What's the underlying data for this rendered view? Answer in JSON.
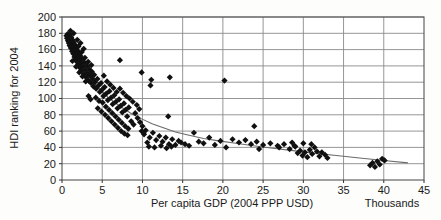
{
  "chart_data": {
    "type": "scatter",
    "title": "",
    "xlabel": "Per capita GDP (2004 PPP USD)",
    "ylabel": "HDI ranking for 2004",
    "x_unit_note": "Thousands",
    "xlim": [
      0,
      45
    ],
    "ylim": [
      0,
      200
    ],
    "xticks": [
      0,
      5,
      10,
      15,
      20,
      25,
      30,
      35,
      40,
      45
    ],
    "yticks": [
      0,
      20,
      40,
      60,
      80,
      100,
      120,
      140,
      160,
      180,
      200
    ],
    "grid": true,
    "grid_color": "#8a8a8a",
    "marker": "diamond",
    "marker_color": "#101010",
    "marker_size": 3.1,
    "trendline": {
      "present": true,
      "color": "#6b6b6b",
      "description": "smooth decreasing curve from upper-left to lower-right",
      "points": [
        [
          0.4,
          178
        ],
        [
          0.8,
          170
        ],
        [
          1.2,
          162
        ],
        [
          1.7,
          152
        ],
        [
          2.2,
          143
        ],
        [
          2.8,
          134
        ],
        [
          3.4,
          126
        ],
        [
          4.1,
          118
        ],
        [
          4.9,
          110
        ],
        [
          5.7,
          102
        ],
        [
          6.6,
          95
        ],
        [
          7.6,
          88
        ],
        [
          8.7,
          81
        ],
        [
          9.9,
          75
        ],
        [
          11.2,
          69
        ],
        [
          12.6,
          64
        ],
        [
          14.1,
          59
        ],
        [
          15.8,
          55
        ],
        [
          17.6,
          51
        ],
        [
          19.5,
          48
        ],
        [
          21.6,
          45
        ],
        [
          23.8,
          42
        ],
        [
          26.2,
          39
        ],
        [
          28.7,
          36
        ],
        [
          31.3,
          33
        ],
        [
          34.1,
          30
        ],
        [
          37.0,
          27
        ],
        [
          40.0,
          24
        ],
        [
          43.0,
          21
        ]
      ]
    },
    "legend": {
      "present": false
    },
    "points": [
      [
        0.55,
        177
      ],
      [
        0.62,
        174
      ],
      [
        0.7,
        179
      ],
      [
        0.74,
        171
      ],
      [
        0.8,
        176
      ],
      [
        0.85,
        168
      ],
      [
        0.9,
        173
      ],
      [
        0.95,
        165
      ],
      [
        1.0,
        178
      ],
      [
        1.05,
        170
      ],
      [
        1.1,
        162
      ],
      [
        1.15,
        175
      ],
      [
        1.2,
        166
      ],
      [
        1.25,
        158
      ],
      [
        1.3,
        172
      ],
      [
        1.35,
        163
      ],
      [
        1.4,
        155
      ],
      [
        1.45,
        169
      ],
      [
        1.5,
        160
      ],
      [
        1.55,
        151
      ],
      [
        1.6,
        166
      ],
      [
        1.65,
        157
      ],
      [
        1.7,
        148
      ],
      [
        1.75,
        163
      ],
      [
        1.8,
        154
      ],
      [
        1.85,
        145
      ],
      [
        1.9,
        159
      ],
      [
        1.95,
        150
      ],
      [
        2.0,
        141
      ],
      [
        2.1,
        156
      ],
      [
        2.15,
        147
      ],
      [
        2.2,
        138
      ],
      [
        2.3,
        152
      ],
      [
        2.35,
        143
      ],
      [
        2.4,
        134
      ],
      [
        2.5,
        148
      ],
      [
        2.6,
        139
      ],
      [
        2.7,
        130
      ],
      [
        2.8,
        144
      ],
      [
        2.9,
        135
      ],
      [
        3.0,
        126
      ],
      [
        3.1,
        140
      ],
      [
        3.2,
        131
      ],
      [
        3.3,
        122
      ],
      [
        3.4,
        136
      ],
      [
        3.5,
        128
      ],
      [
        3.6,
        119
      ],
      [
        3.7,
        133
      ],
      [
        3.8,
        124
      ],
      [
        3.9,
        115
      ],
      [
        1.05,
        183
      ],
      [
        1.45,
        180
      ],
      [
        1.9,
        172
      ],
      [
        2.3,
        168
      ],
      [
        2.7,
        161
      ],
      [
        2.05,
        164
      ],
      [
        2.45,
        157
      ],
      [
        2.85,
        150
      ],
      [
        3.25,
        145
      ],
      [
        3.65,
        141
      ],
      [
        1.3,
        146
      ],
      [
        1.75,
        139
      ],
      [
        2.15,
        132
      ],
      [
        2.55,
        127
      ],
      [
        2.95,
        121
      ],
      [
        4.0,
        129
      ],
      [
        4.1,
        120
      ],
      [
        4.25,
        112
      ],
      [
        4.4,
        124
      ],
      [
        4.55,
        116
      ],
      [
        4.7,
        108
      ],
      [
        4.85,
        119
      ],
      [
        5.0,
        111
      ],
      [
        5.15,
        103
      ],
      [
        5.3,
        114
      ],
      [
        5.5,
        106
      ],
      [
        5.7,
        98
      ],
      [
        5.9,
        109
      ],
      [
        6.1,
        101
      ],
      [
        6.3,
        93
      ],
      [
        6.5,
        104
      ],
      [
        6.7,
        96
      ],
      [
        6.9,
        88
      ],
      [
        7.1,
        99
      ],
      [
        7.3,
        91
      ],
      [
        7.5,
        83
      ],
      [
        7.7,
        94
      ],
      [
        7.9,
        86
      ],
      [
        8.1,
        78
      ],
      [
        8.3,
        89
      ],
      [
        3.3,
        103
      ],
      [
        3.55,
        99
      ],
      [
        4.2,
        101
      ],
      [
        4.6,
        97
      ],
      [
        5.05,
        95
      ],
      [
        5.45,
        90
      ],
      [
        5.85,
        86
      ],
      [
        6.25,
        82
      ],
      [
        6.65,
        78
      ],
      [
        7.05,
        74
      ],
      [
        7.45,
        70
      ],
      [
        7.85,
        66
      ],
      [
        8.25,
        63
      ],
      [
        8.6,
        72
      ],
      [
        8.9,
        68
      ],
      [
        4.45,
        88
      ],
      [
        4.9,
        84
      ],
      [
        5.35,
        80
      ],
      [
        5.75,
        76
      ],
      [
        6.15,
        72
      ],
      [
        6.55,
        68
      ],
      [
        6.95,
        64
      ],
      [
        7.35,
        60
      ],
      [
        7.75,
        57
      ],
      [
        8.15,
        55
      ],
      [
        5.2,
        128
      ],
      [
        5.6,
        121
      ],
      [
        6.0,
        117
      ],
      [
        6.4,
        113
      ],
      [
        6.8,
        108
      ],
      [
        7.2,
        112
      ],
      [
        7.6,
        107
      ],
      [
        8.0,
        103
      ],
      [
        8.4,
        100
      ],
      [
        8.8,
        96
      ],
      [
        9.1,
        82
      ],
      [
        9.4,
        76
      ],
      [
        9.7,
        71
      ],
      [
        10.0,
        66
      ],
      [
        10.4,
        61
      ],
      [
        9.3,
        92
      ],
      [
        9.6,
        87
      ],
      [
        9.9,
        60
      ],
      [
        10.2,
        56
      ],
      [
        10.6,
        46
      ],
      [
        10.9,
        52
      ],
      [
        11.3,
        58
      ],
      [
        11.7,
        49
      ],
      [
        12.1,
        54
      ],
      [
        12.5,
        47
      ],
      [
        12.9,
        52
      ],
      [
        13.3,
        44
      ],
      [
        13.7,
        50
      ],
      [
        14.1,
        43
      ],
      [
        14.5,
        48
      ],
      [
        10.8,
        41
      ],
      [
        11.5,
        40
      ],
      [
        12.3,
        42
      ],
      [
        13.0,
        39
      ],
      [
        13.6,
        41
      ],
      [
        14.8,
        46
      ],
      [
        15.3,
        44
      ],
      [
        15.8,
        42
      ],
      [
        16.4,
        58
      ],
      [
        17.0,
        47
      ],
      [
        17.6,
        45
      ],
      [
        18.3,
        52
      ],
      [
        19.0,
        43
      ],
      [
        19.7,
        48
      ],
      [
        20.4,
        40
      ],
      [
        11.0,
        116
      ],
      [
        13.2,
        78
      ],
      [
        13.4,
        126
      ],
      [
        7.2,
        147
      ],
      [
        9.9,
        132
      ],
      [
        11.1,
        123
      ],
      [
        20.2,
        122
      ],
      [
        23.9,
        66
      ],
      [
        21.2,
        50
      ],
      [
        22.0,
        46
      ],
      [
        22.8,
        49
      ],
      [
        23.5,
        44
      ],
      [
        24.2,
        47
      ],
      [
        25.0,
        43
      ],
      [
        25.9,
        45
      ],
      [
        26.8,
        42
      ],
      [
        27.6,
        44
      ],
      [
        28.3,
        38
      ],
      [
        28.6,
        46
      ],
      [
        28.9,
        42
      ],
      [
        29.3,
        33
      ],
      [
        29.6,
        36
      ],
      [
        29.9,
        30
      ],
      [
        30.2,
        34
      ],
      [
        30.5,
        28
      ],
      [
        30.8,
        37
      ],
      [
        31.1,
        32
      ],
      [
        31.4,
        40
      ],
      [
        31.7,
        35
      ],
      [
        32.0,
        29
      ],
      [
        32.3,
        34
      ],
      [
        32.7,
        31
      ],
      [
        33.0,
        27
      ],
      [
        30.0,
        45
      ],
      [
        31.0,
        44
      ],
      [
        38.3,
        18
      ],
      [
        38.6,
        21
      ],
      [
        38.9,
        16
      ],
      [
        39.2,
        23
      ],
      [
        39.5,
        19
      ],
      [
        39.8,
        26
      ],
      [
        40.1,
        24
      ],
      [
        29.0,
        41
      ],
      [
        27.0,
        40
      ],
      [
        24.5,
        38
      ]
    ]
  },
  "axes": {
    "y_tick_labels": [
      "200",
      "180",
      "160",
      "140",
      "120",
      "100",
      "80",
      "60",
      "40",
      "20",
      "0"
    ],
    "x_tick_labels": [
      "0",
      "5",
      "10",
      "15",
      "20",
      "25",
      "30",
      "35",
      "40",
      "45"
    ],
    "y_title": "HDI ranking for 2004",
    "x_title": "Per capita GDP (2004 PPP USD)",
    "x_unit": "Thousands"
  }
}
